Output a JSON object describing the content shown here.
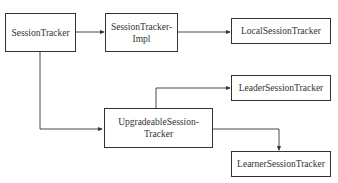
{
  "diagram": {
    "type": "class-hierarchy",
    "nodes": [
      {
        "id": "session_tracker",
        "label": "SessionTracker"
      },
      {
        "id": "session_tracker_impl",
        "label": "SessionTracker-\nImpl"
      },
      {
        "id": "local_session_tracker",
        "label": "LocalSessionTracker"
      },
      {
        "id": "leader_session_tracker",
        "label": "LeaderSessionTracker"
      },
      {
        "id": "upgradeable_session_tracker",
        "label": "UpgradeableSession-\nTracker"
      },
      {
        "id": "learner_session_tracker",
        "label": "LearnerSessionTracker"
      }
    ],
    "edges": [
      {
        "from": "session_tracker",
        "to": "session_tracker_impl"
      },
      {
        "from": "session_tracker_impl",
        "to": "local_session_tracker"
      },
      {
        "from": "session_tracker",
        "to": "upgradeable_session_tracker"
      },
      {
        "from": "upgradeable_session_tracker",
        "to": "leader_session_tracker"
      },
      {
        "from": "upgradeable_session_tracker",
        "to": "learner_session_tracker"
      }
    ],
    "colors": {
      "stroke": "#333333",
      "background": "#ffffff",
      "text": "#333333"
    }
  }
}
